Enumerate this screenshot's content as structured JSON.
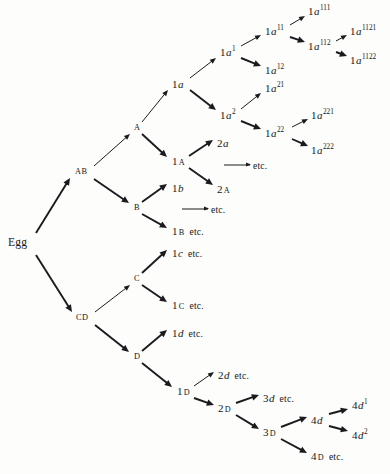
{
  "figure": {
    "kind": "cell-lineage-tree",
    "orientation": "left-to-right",
    "ink_color": "#1b1b1f",
    "background_color": "#fdfdfb",
    "continuation_word": "etc."
  },
  "nodes": [
    {
      "id": "egg",
      "text": "Egg",
      "style": "root",
      "x": 8,
      "y": 243
    },
    {
      "id": "AB",
      "text": "AB",
      "style": "group",
      "x": 75,
      "y": 172
    },
    {
      "id": "CD",
      "text": "CD",
      "style": "group",
      "x": 76,
      "y": 318
    },
    {
      "id": "A",
      "text": "A",
      "style": "cap",
      "x": 134,
      "y": 128
    },
    {
      "id": "B",
      "text": "B",
      "style": "cap",
      "x": 134,
      "y": 208
    },
    {
      "id": "C",
      "text": "C",
      "style": "cap",
      "x": 134,
      "y": 279
    },
    {
      "id": "D",
      "text": "D",
      "style": "cap",
      "x": 134,
      "y": 357
    },
    {
      "id": "1a",
      "num": "1",
      "ital": "a",
      "style": "cell",
      "x": 172,
      "y": 84
    },
    {
      "id": "1A",
      "num": "1",
      "sc": "A",
      "style": "cell",
      "x": 172,
      "y": 162
    },
    {
      "id": "1b",
      "num": "1",
      "ital": "b",
      "style": "cell",
      "x": 172,
      "y": 188
    },
    {
      "id": "1Betc",
      "num": "1",
      "sc": "B",
      "etc": "etc.",
      "style": "cell",
      "x": 172,
      "y": 232
    },
    {
      "id": "1cetc",
      "num": "1",
      "ital": "c",
      "etc": "etc.",
      "style": "cell",
      "x": 172,
      "y": 253
    },
    {
      "id": "1Cetc",
      "num": "1",
      "sc": "C",
      "etc": "etc.",
      "style": "cell",
      "x": 172,
      "y": 306
    },
    {
      "id": "1detc",
      "num": "1",
      "ital": "d",
      "etc": "etc.",
      "style": "cell",
      "x": 172,
      "y": 333
    },
    {
      "id": "1D",
      "num": "1",
      "sc": "D",
      "style": "cell",
      "x": 177,
      "y": 392
    },
    {
      "id": "2a",
      "num": "2",
      "ital": "a",
      "style": "cell",
      "x": 217,
      "y": 143
    },
    {
      "id": "2A",
      "num": "2",
      "sc": "A",
      "style": "cell",
      "x": 217,
      "y": 190
    },
    {
      "id": "2detc",
      "num": "2",
      "ital": "d",
      "etc": "etc.",
      "style": "cell",
      "x": 218,
      "y": 375
    },
    {
      "id": "2D",
      "num": "2",
      "sc": "D",
      "style": "cell",
      "x": 218,
      "y": 409
    },
    {
      "id": "1a1",
      "num": "1",
      "ital": "a",
      "sup": "1",
      "style": "cell",
      "x": 220,
      "y": 52
    },
    {
      "id": "1a2",
      "num": "1",
      "ital": "a",
      "sup": "2",
      "style": "cell",
      "x": 220,
      "y": 115
    },
    {
      "id": "1a11",
      "num": "1",
      "ital": "a",
      "sup": "11",
      "style": "cell",
      "x": 265,
      "y": 31
    },
    {
      "id": "1a12",
      "num": "1",
      "ital": "a",
      "sup": "12",
      "style": "cell",
      "x": 265,
      "y": 70
    },
    {
      "id": "1a21",
      "num": "1",
      "ital": "a",
      "sup": "21",
      "style": "cell",
      "x": 265,
      "y": 88
    },
    {
      "id": "1a22",
      "num": "1",
      "ital": "a",
      "sup": "22",
      "style": "cell",
      "x": 265,
      "y": 133
    },
    {
      "id": "1a111",
      "num": "1",
      "ital": "a",
      "sup": "111",
      "style": "cell",
      "x": 308,
      "y": 11
    },
    {
      "id": "1a112",
      "num": "1",
      "ital": "a",
      "sup": "112",
      "style": "cell",
      "x": 308,
      "y": 46
    },
    {
      "id": "1a221",
      "num": "1",
      "ital": "a",
      "sup": "221",
      "style": "cell",
      "x": 311,
      "y": 115
    },
    {
      "id": "1a222",
      "num": "1",
      "ital": "a",
      "sup": "222",
      "style": "cell",
      "x": 311,
      "y": 150
    },
    {
      "id": "1a1121",
      "num": "1",
      "ital": "a",
      "sup": "1121",
      "style": "cell",
      "x": 350,
      "y": 31
    },
    {
      "id": "1a1122",
      "num": "1",
      "ital": "a",
      "sup": "1122",
      "style": "cell",
      "x": 350,
      "y": 60
    },
    {
      "id": "3detc",
      "num": "3",
      "ital": "d",
      "etc": "etc.",
      "style": "cell",
      "x": 263,
      "y": 398
    },
    {
      "id": "3D",
      "num": "3",
      "sc": "D",
      "style": "cell",
      "x": 263,
      "y": 433
    },
    {
      "id": "4d",
      "num": "4",
      "ital": "d",
      "style": "cell",
      "x": 311,
      "y": 420
    },
    {
      "id": "4Detc",
      "num": "4",
      "sc": "D",
      "etc": "etc.",
      "style": "cell",
      "x": 311,
      "y": 457
    },
    {
      "id": "4d1",
      "num": "4",
      "ital": "d",
      "sup": "1",
      "style": "cell",
      "x": 352,
      "y": 405
    },
    {
      "id": "4d2",
      "num": "4",
      "ital": "d",
      "sup": "2",
      "style": "cell",
      "x": 352,
      "y": 435
    }
  ],
  "continuations": [
    {
      "id": "cont-1A",
      "text": "etc.",
      "x": 224,
      "y": 165
    },
    {
      "id": "cont-B",
      "text": "etc.",
      "x": 182,
      "y": 209
    }
  ],
  "edges": [
    {
      "from": "egg",
      "to": "AB",
      "x1": 36,
      "y1": 233,
      "x2": 70,
      "y2": 178,
      "weight": "thick"
    },
    {
      "from": "egg",
      "to": "CD",
      "x1": 36,
      "y1": 255,
      "x2": 72,
      "y2": 312,
      "weight": "thick"
    },
    {
      "from": "AB",
      "to": "A",
      "x1": 94,
      "y1": 166,
      "x2": 130,
      "y2": 134,
      "weight": "thin"
    },
    {
      "from": "AB",
      "to": "B",
      "x1": 94,
      "y1": 179,
      "x2": 129,
      "y2": 203,
      "weight": "thick"
    },
    {
      "from": "CD",
      "to": "C",
      "x1": 95,
      "y1": 312,
      "x2": 130,
      "y2": 285,
      "weight": "thin"
    },
    {
      "from": "CD",
      "to": "D",
      "x1": 95,
      "y1": 325,
      "x2": 129,
      "y2": 352,
      "weight": "thick"
    },
    {
      "from": "A",
      "to": "1a",
      "x1": 142,
      "y1": 122,
      "x2": 168,
      "y2": 90,
      "weight": "thin"
    },
    {
      "from": "A",
      "to": "1A",
      "x1": 142,
      "y1": 134,
      "x2": 167,
      "y2": 157,
      "weight": "thick"
    },
    {
      "from": "B",
      "to": "1b",
      "x1": 142,
      "y1": 202,
      "x2": 167,
      "y2": 184,
      "weight": "thick"
    },
    {
      "from": "B",
      "to": "1Betc",
      "x1": 142,
      "y1": 214,
      "x2": 167,
      "y2": 228,
      "weight": "thick"
    },
    {
      "from": "C",
      "to": "1cetc",
      "x1": 142,
      "y1": 273,
      "x2": 167,
      "y2": 250,
      "weight": "thick"
    },
    {
      "from": "C",
      "to": "1Cetc",
      "x1": 142,
      "y1": 285,
      "x2": 167,
      "y2": 302,
      "weight": "thick"
    },
    {
      "from": "D",
      "to": "1detc",
      "x1": 142,
      "y1": 351,
      "x2": 167,
      "y2": 330,
      "weight": "thick"
    },
    {
      "from": "D",
      "to": "1D",
      "x1": 142,
      "y1": 363,
      "x2": 172,
      "y2": 387,
      "weight": "thick"
    },
    {
      "from": "1A",
      "to": "2a",
      "x1": 189,
      "y1": 156,
      "x2": 213,
      "y2": 140,
      "weight": "thick"
    },
    {
      "from": "1A",
      "to": "2A",
      "x1": 189,
      "y1": 168,
      "x2": 213,
      "y2": 185,
      "weight": "thick"
    },
    {
      "from": "1a",
      "to": "1a1",
      "x1": 190,
      "y1": 78,
      "x2": 216,
      "y2": 58,
      "weight": "thin"
    },
    {
      "from": "1a",
      "to": "1a2",
      "x1": 190,
      "y1": 90,
      "x2": 216,
      "y2": 110,
      "weight": "thick"
    },
    {
      "from": "1a1",
      "to": "1a11",
      "x1": 241,
      "y1": 46,
      "x2": 261,
      "y2": 35,
      "weight": "thin"
    },
    {
      "from": "1a1",
      "to": "1a12",
      "x1": 241,
      "y1": 58,
      "x2": 261,
      "y2": 66,
      "weight": "thick"
    },
    {
      "from": "1a2",
      "to": "1a21",
      "x1": 241,
      "y1": 109,
      "x2": 261,
      "y2": 93,
      "weight": "thin"
    },
    {
      "from": "1a2",
      "to": "1a22",
      "x1": 241,
      "y1": 121,
      "x2": 261,
      "y2": 129,
      "weight": "thick"
    },
    {
      "from": "1a11",
      "to": "1a111",
      "x1": 290,
      "y1": 25,
      "x2": 305,
      "y2": 16,
      "weight": "thin"
    },
    {
      "from": "1a11",
      "to": "1a112",
      "x1": 290,
      "y1": 37,
      "x2": 305,
      "y2": 42,
      "weight": "thick"
    },
    {
      "from": "1a22",
      "to": "1a221",
      "x1": 292,
      "y1": 127,
      "x2": 308,
      "y2": 119,
      "weight": "thin"
    },
    {
      "from": "1a22",
      "to": "1a222",
      "x1": 292,
      "y1": 139,
      "x2": 308,
      "y2": 146,
      "weight": "thick"
    },
    {
      "from": "1a112",
      "to": "1a1121",
      "x1": 336,
      "y1": 41,
      "x2": 347,
      "y2": 35,
      "weight": "thin"
    },
    {
      "from": "1a112",
      "to": "1a1122",
      "x1": 336,
      "y1": 52,
      "x2": 347,
      "y2": 56,
      "weight": "thick"
    },
    {
      "from": "1D",
      "to": "2detc",
      "x1": 194,
      "y1": 386,
      "x2": 214,
      "y2": 372,
      "weight": "thin"
    },
    {
      "from": "1D",
      "to": "2D",
      "x1": 194,
      "y1": 398,
      "x2": 214,
      "y2": 405,
      "weight": "thick"
    },
    {
      "from": "2D",
      "to": "3detc",
      "x1": 236,
      "y1": 403,
      "x2": 259,
      "y2": 395,
      "weight": "thick"
    },
    {
      "from": "2D",
      "to": "3D",
      "x1": 236,
      "y1": 415,
      "x2": 259,
      "y2": 429,
      "weight": "thick"
    },
    {
      "from": "3D",
      "to": "4d",
      "x1": 281,
      "y1": 427,
      "x2": 307,
      "y2": 417,
      "weight": "thick"
    },
    {
      "from": "3D",
      "to": "4Detc",
      "x1": 281,
      "y1": 439,
      "x2": 307,
      "y2": 453,
      "weight": "thick"
    },
    {
      "from": "4d",
      "to": "4d1",
      "x1": 329,
      "y1": 414,
      "x2": 348,
      "y2": 409,
      "weight": "thick"
    },
    {
      "from": "4d",
      "to": "4d2",
      "x1": 329,
      "y1": 426,
      "x2": 348,
      "y2": 431,
      "weight": "thick"
    }
  ]
}
